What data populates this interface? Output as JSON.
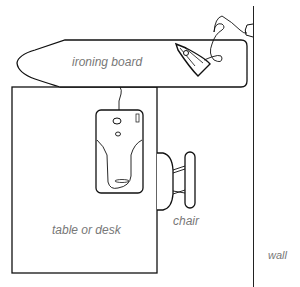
{
  "diagram": {
    "labels": {
      "ironing_board": "ironing board",
      "table": "table or desk",
      "chair": "chair",
      "wall": "wall"
    },
    "items": [
      "ironing-board",
      "iron",
      "sewing-machine",
      "table",
      "chair",
      "wall",
      "outlet"
    ],
    "colors": {
      "stroke": "#111111",
      "label": "#777777",
      "background": "#ffffff"
    }
  }
}
